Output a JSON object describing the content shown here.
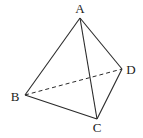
{
  "diagram": {
    "type": "tetrahedron",
    "stroke_color": "#2a2a2a",
    "vertices": {
      "A": {
        "label": "A",
        "x": 80,
        "y": 18,
        "lx": 80,
        "ly": 13
      },
      "B": {
        "label": "B",
        "x": 25,
        "y": 95,
        "lx": 15,
        "ly": 101
      },
      "C": {
        "label": "C",
        "x": 97,
        "y": 119,
        "lx": 97,
        "ly": 132
      },
      "D": {
        "label": "D",
        "x": 122,
        "y": 69,
        "lx": 131,
        "ly": 74
      }
    },
    "edges": [
      {
        "from": "A",
        "to": "B",
        "style": "solid"
      },
      {
        "from": "A",
        "to": "C",
        "style": "solid"
      },
      {
        "from": "A",
        "to": "D",
        "style": "solid"
      },
      {
        "from": "B",
        "to": "C",
        "style": "solid"
      },
      {
        "from": "C",
        "to": "D",
        "style": "solid"
      },
      {
        "from": "B",
        "to": "D",
        "style": "dashed"
      }
    ]
  }
}
